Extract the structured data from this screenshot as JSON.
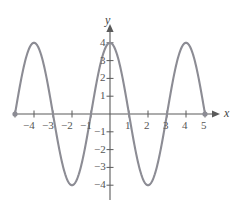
{
  "figure": {
    "axis_labels": {
      "x": "x",
      "y": "y"
    },
    "curve_color": "#8c8c94",
    "axis_color": "#5a5a5a",
    "endpoint_marker": "filled-dot"
  },
  "chart_data": {
    "type": "line",
    "title": "",
    "xlabel": "x",
    "ylabel": "y",
    "xlim": [
      -5.6,
      5.6
    ],
    "ylim": [
      -4.8,
      4.8
    ],
    "grid": false,
    "legend": null,
    "xticks": [
      -5,
      -4,
      -3,
      -2,
      -1,
      1,
      2,
      3,
      4,
      5
    ],
    "xtick_labels": [
      "",
      "−4",
      "−3",
      "−2",
      "−1",
      "",
      "2",
      "3",
      "4",
      "5"
    ],
    "yticks": [
      -4,
      -3,
      -2,
      -1,
      1,
      2,
      3,
      4
    ],
    "ytick_labels": [
      "−4",
      "−3",
      "−2",
      "−1",
      "1",
      "2",
      "3",
      "4"
    ],
    "displayed_x_labels": [
      "−4",
      "−3",
      "−2",
      "−1",
      "1",
      "2",
      "3",
      "4",
      "5"
    ],
    "displayed_y_labels": [
      "4",
      "3",
      "2",
      "1",
      "−1",
      "−2",
      "−3",
      "−4"
    ],
    "series": [
      {
        "name": "y = 4 cos(πx/2)",
        "amplitude": 4,
        "period": 4,
        "domain": [
          -5,
          5
        ],
        "maxima": [
          {
            "x": -4,
            "y": 4
          },
          {
            "x": 0,
            "y": 4
          },
          {
            "x": 4,
            "y": 4
          }
        ],
        "minima": [
          {
            "x": -2,
            "y": -4
          },
          {
            "x": 2,
            "y": -4
          }
        ],
        "zeros": [
          -5,
          -3,
          -1,
          1,
          3,
          5
        ],
        "endpoints": [
          {
            "x": -5,
            "y": 0
          },
          {
            "x": 5,
            "y": 0
          }
        ]
      }
    ]
  }
}
